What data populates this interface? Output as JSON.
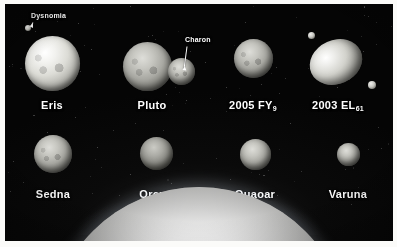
{
  "figure": {
    "background_color": "#060606",
    "frame_color": "#fbfbf9",
    "label_color": "#ffffff"
  },
  "callouts": [
    {
      "id": "dysnomia",
      "label": "Dysnomia",
      "parent": "Eris",
      "x": 31,
      "y": 12
    },
    {
      "id": "charon",
      "label": "Charon",
      "parent": "Pluto",
      "x": 185,
      "y": 36
    }
  ],
  "rows": [
    {
      "row": 1,
      "bodies": [
        {
          "name": "Eris",
          "label": "Eris",
          "cx": 52,
          "cy": 63,
          "d": 55,
          "shape": "sphere",
          "tone": "bright",
          "label_x": 52,
          "label_y": 99,
          "moons": [
            {
              "name": "Dysnomia",
              "cx": 28,
              "cy": 28,
              "d": 6
            }
          ]
        },
        {
          "name": "Pluto",
          "label": "Pluto",
          "cx": 147,
          "cy": 66,
          "d": 49,
          "shape": "sphere",
          "tone": "dim",
          "label_x": 152,
          "label_y": 99,
          "moons": [
            {
              "name": "Charon",
              "cx": 181,
              "cy": 71,
              "d": 27
            }
          ]
        },
        {
          "name": "2005 FY9",
          "label": "2005 FY",
          "sub": "9",
          "cx": 253,
          "cy": 58,
          "d": 39,
          "shape": "sphere",
          "tone": "dim",
          "label_x": 253,
          "label_y": 99,
          "moons": []
        },
        {
          "name": "2003 EL61",
          "label": "2003 EL",
          "sub": "61",
          "cx": 336,
          "cy": 62,
          "d": 54,
          "shape": "ellipsoid",
          "tone": "bright",
          "w": 54,
          "h": 44,
          "rotation": -24,
          "label_x": 338,
          "label_y": 99,
          "moons": [
            {
              "name": "Namaka",
              "cx": 311,
              "cy": 35,
              "d": 7
            },
            {
              "name": "Hi'iaka",
              "cx": 372,
              "cy": 85,
              "d": 8
            }
          ]
        }
      ]
    },
    {
      "row": 2,
      "bodies": [
        {
          "name": "Sedna",
          "label": "Sedna",
          "cx": 53,
          "cy": 154,
          "d": 38,
          "shape": "sphere",
          "tone": "dim",
          "label_x": 53,
          "label_y": 188,
          "moons": []
        },
        {
          "name": "Orcus",
          "label": "Orcus",
          "cx": 156,
          "cy": 153,
          "d": 33,
          "shape": "sphere",
          "tone": "dark",
          "label_x": 156,
          "label_y": 188,
          "moons": []
        },
        {
          "name": "Quaoar",
          "label": "Quaoar",
          "cx": 255,
          "cy": 154,
          "d": 31,
          "shape": "sphere",
          "tone": "dim",
          "label_x": 255,
          "label_y": 188,
          "moons": []
        },
        {
          "name": "Varuna",
          "label": "Varuna",
          "cx": 348,
          "cy": 154,
          "d": 23,
          "shape": "sphere",
          "tone": "dim",
          "label_x": 348,
          "label_y": 188,
          "moons": []
        }
      ]
    }
  ],
  "earth": {
    "name": "Earth",
    "visible_as": "limb-arc-at-bottom",
    "arc_left_x": 85,
    "arc_right_x": 320,
    "arc_top_y": 205
  }
}
